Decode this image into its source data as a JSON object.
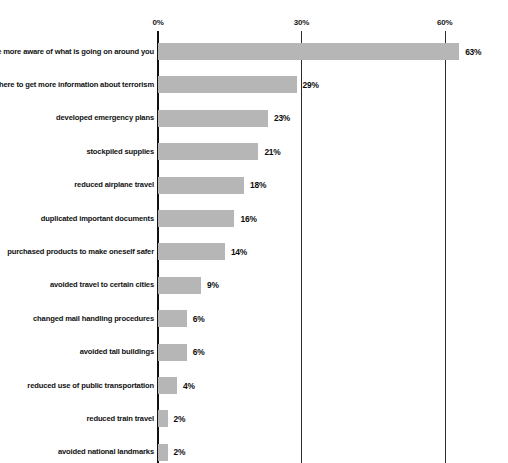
{
  "chart_data": {
    "type": "bar",
    "orientation": "horizontal",
    "title": "",
    "subtitle": "",
    "xlabel": "",
    "ylabel": "",
    "xlim": [
      0,
      66
    ],
    "grid": true,
    "legend": null,
    "axis": {
      "tick_labels": [
        "0%",
        "30%",
        "60%"
      ],
      "tick_values": [
        0,
        30,
        60
      ]
    },
    "value_suffix": "%",
    "bar_color": "#b6b6b6",
    "categories": [
      "become more aware of what is going on around you",
      "learned where to get more information about terrorism",
      "developed emergency plans",
      "stockpiled supplies",
      "reduced airplane travel",
      "duplicated important documents",
      "purchased products to make oneself safer",
      "avoided travel to certain cities",
      "changed mail handling procedures",
      "avoided tall buildings",
      "reduced use of public transportation",
      "reduced train travel",
      "avoided national landmarks"
    ],
    "values": [
      63,
      29,
      23,
      21,
      18,
      16,
      14,
      9,
      6,
      6,
      4,
      2,
      2
    ],
    "value_labels": [
      "63%",
      "29%",
      "23%",
      "21%",
      "18%",
      "16%",
      "14%",
      "9%",
      "6%",
      "6%",
      "4%",
      "2%",
      "2%"
    ]
  }
}
